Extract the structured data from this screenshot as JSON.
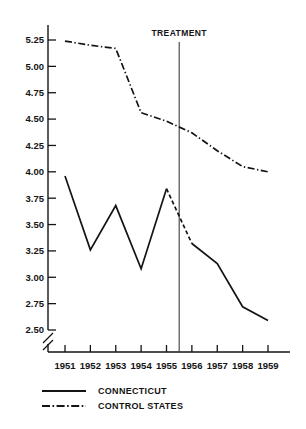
{
  "chart_data": {
    "type": "line",
    "title": "",
    "xlabel": "",
    "ylabel": "",
    "categories": [
      "1951",
      "1952",
      "1953",
      "1954",
      "1955",
      "1956",
      "1957",
      "1958",
      "1959"
    ],
    "x": [
      1951,
      1952,
      1953,
      1954,
      1955,
      1956,
      1957,
      1958,
      1959
    ],
    "xlim": [
      1950.6,
      1959.4
    ],
    "ylim": [
      2.5,
      5.25
    ],
    "grid": false,
    "legend_position": "bottom-left",
    "y_axis_break": true,
    "y_ticks": [
      "5.25",
      "5.00",
      "4.75",
      "4.50",
      "4.25",
      "4.00",
      "3.75",
      "3.50",
      "3.25",
      "3.00",
      "2.75",
      "2.50"
    ],
    "y_tick_values": [
      5.25,
      5.0,
      4.75,
      4.5,
      4.25,
      4.0,
      3.75,
      3.5,
      3.25,
      3.0,
      2.75,
      2.5
    ],
    "series": [
      {
        "name": "CONNECTICUT",
        "style": "solid",
        "values": [
          3.96,
          3.26,
          3.68,
          3.08,
          3.84,
          3.32,
          3.13,
          2.72,
          2.59
        ],
        "dashed_segment": {
          "from_index": 4,
          "to_index": 5
        }
      },
      {
        "name": "CONTROL STATES",
        "style": "dash-dot",
        "values": [
          5.24,
          5.2,
          5.17,
          4.56,
          4.48,
          4.37,
          4.2,
          4.05,
          4.0
        ]
      }
    ],
    "annotations": [
      {
        "name": "treatment-marker",
        "label": "TREATMENT",
        "x": 1955.5,
        "type": "vertical-line"
      }
    ]
  },
  "legend": {
    "items": [
      {
        "label": "CONNECTICUT",
        "style": "solid"
      },
      {
        "label": "CONTROL STATES",
        "style": "dash-dot"
      }
    ]
  },
  "colors": {
    "ink": "#141414",
    "background": "#ffffff",
    "treatment_line": "#3d3d3d"
  }
}
